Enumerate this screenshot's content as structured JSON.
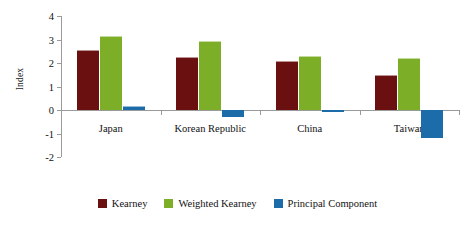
{
  "chart_data": {
    "type": "bar",
    "title": "",
    "subtitle": "",
    "xlabel": "",
    "ylabel": "Index",
    "categories": [
      "Japan",
      "Korean Republic",
      "China",
      "Taiwan"
    ],
    "series": [
      {
        "name": "Kearney",
        "color": "#6B1010",
        "values": [
          2.55,
          2.25,
          2.1,
          1.5
        ]
      },
      {
        "name": "Weighted Kearney",
        "color": "#7DAE28",
        "values": [
          3.15,
          2.95,
          2.3,
          2.2
        ]
      },
      {
        "name": "Principal Component",
        "color": "#1B6CA8",
        "values": [
          0.18,
          -0.3,
          -0.08,
          -1.2
        ]
      }
    ],
    "ylim": [
      -2,
      4
    ],
    "yticks": [
      4,
      3,
      2,
      1,
      0,
      -1,
      -2
    ],
    "ytick_labels": [
      "4",
      "3",
      "2",
      "1",
      "0",
      "-1",
      "-2"
    ],
    "grid": false,
    "legend_position": "bottom",
    "annotations": []
  },
  "axis": {
    "y_title": "Index"
  },
  "legend": {
    "items": [
      {
        "label": "Kearney"
      },
      {
        "label": "Weighted Kearney"
      },
      {
        "label": "Principal Component"
      }
    ]
  }
}
